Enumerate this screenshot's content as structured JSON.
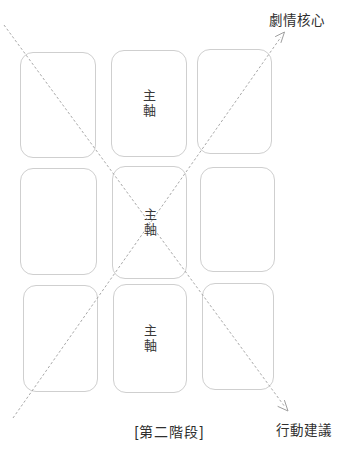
{
  "diagram": {
    "stage_caption": "[第二階段]",
    "arrows": {
      "top_right_label": "劇情核心",
      "bottom_right_label": "行動建議"
    },
    "grid": {
      "rows": 3,
      "cols": 3,
      "center_column_label": "主軸"
    },
    "colors": {
      "background": "#ffffff",
      "card_border": "#cfcfcf",
      "dashed_line": "#9e9e9e",
      "text": "#2f2f2f"
    }
  }
}
